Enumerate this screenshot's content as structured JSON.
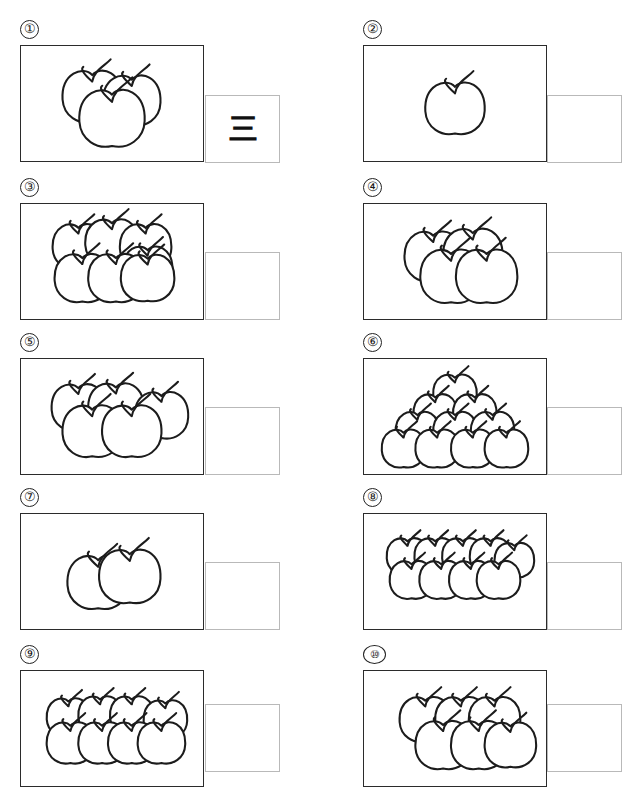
{
  "worksheet": {
    "title": "Count the apples worksheet",
    "page_width": 640,
    "page_height": 796,
    "answer_box_label": "answer-box",
    "items": [
      {
        "number": "①",
        "apple_count": 3,
        "answer": "三",
        "answer_filled": true,
        "arrangement": "cluster",
        "num_x": 20,
        "num_y": 20,
        "box_x": 20,
        "box_y": 45,
        "box_w": 184,
        "box_h": 117,
        "ans_x": 205,
        "ans_y": 95,
        "ans_w": 75,
        "ans_h": 68
      },
      {
        "number": "②",
        "apple_count": 1,
        "answer": "",
        "answer_filled": false,
        "arrangement": "cluster",
        "num_x": 363,
        "num_y": 20,
        "box_x": 363,
        "box_y": 45,
        "box_w": 184,
        "box_h": 117,
        "ans_x": 547,
        "ans_y": 95,
        "ans_w": 75,
        "ans_h": 68
      },
      {
        "number": "③",
        "apple_count": 7,
        "answer": "",
        "answer_filled": false,
        "arrangement": "stack",
        "num_x": 20,
        "num_y": 178,
        "box_x": 20,
        "box_y": 203,
        "box_w": 184,
        "box_h": 117,
        "ans_x": 205,
        "ans_y": 252,
        "ans_w": 75,
        "ans_h": 68
      },
      {
        "number": "④",
        "apple_count": 4,
        "answer": "",
        "answer_filled": false,
        "arrangement": "cluster",
        "num_x": 363,
        "num_y": 178,
        "box_x": 363,
        "box_y": 203,
        "box_w": 184,
        "box_h": 117,
        "ans_x": 547,
        "ans_y": 252,
        "ans_w": 75,
        "ans_h": 68
      },
      {
        "number": "⑤",
        "apple_count": 5,
        "answer": "",
        "answer_filled": false,
        "arrangement": "cluster",
        "num_x": 20,
        "num_y": 333,
        "box_x": 20,
        "box_y": 358,
        "box_w": 184,
        "box_h": 117,
        "ans_x": 205,
        "ans_y": 407,
        "ans_w": 75,
        "ans_h": 68
      },
      {
        "number": "⑥",
        "apple_count": 10,
        "answer": "",
        "answer_filled": false,
        "arrangement": "pyramid",
        "num_x": 363,
        "num_y": 333,
        "box_x": 363,
        "box_y": 358,
        "box_w": 184,
        "box_h": 117,
        "ans_x": 547,
        "ans_y": 407,
        "ans_w": 75,
        "ans_h": 68
      },
      {
        "number": "⑦",
        "apple_count": 2,
        "answer": "",
        "answer_filled": false,
        "arrangement": "cluster",
        "num_x": 20,
        "num_y": 488,
        "box_x": 20,
        "box_y": 513,
        "box_w": 184,
        "box_h": 117,
        "ans_x": 205,
        "ans_y": 562,
        "ans_w": 75,
        "ans_h": 68
      },
      {
        "number": "⑧",
        "apple_count": 9,
        "answer": "",
        "answer_filled": false,
        "arrangement": "two-rows",
        "num_x": 363,
        "num_y": 488,
        "box_x": 363,
        "box_y": 513,
        "box_w": 184,
        "box_h": 117,
        "ans_x": 547,
        "ans_y": 562,
        "ans_w": 75,
        "ans_h": 68
      },
      {
        "number": "⑨",
        "apple_count": 8,
        "answer": "",
        "answer_filled": false,
        "arrangement": "two-rows",
        "num_x": 20,
        "num_y": 645,
        "box_x": 20,
        "box_y": 670,
        "box_w": 184,
        "box_h": 117,
        "ans_x": 205,
        "ans_y": 704,
        "ans_w": 75,
        "ans_h": 68
      },
      {
        "number": "⑩",
        "apple_count": 6,
        "answer": "",
        "answer_filled": false,
        "arrangement": "two-rows",
        "num_x": 363,
        "num_y": 645,
        "box_x": 363,
        "box_y": 670,
        "box_w": 184,
        "box_h": 117,
        "ans_x": 547,
        "ans_y": 704,
        "ans_w": 75,
        "ans_h": 68
      }
    ]
  },
  "apple_layouts": {
    "1": [
      [
        92,
        62,
        30
      ]
    ],
    "2": [
      [
        78,
        68,
        31
      ],
      [
        110,
        62,
        31
      ]
    ],
    "3": [
      [
        72,
        50,
        30
      ],
      [
        112,
        54,
        29
      ],
      [
        92,
        72,
        33
      ]
    ],
    "4": [
      [
        70,
        52,
        29
      ],
      [
        110,
        50,
        30
      ],
      [
        88,
        72,
        31
      ],
      [
        124,
        72,
        31
      ]
    ],
    "5": [
      [
        58,
        48,
        27
      ],
      [
        96,
        48,
        28
      ],
      [
        142,
        56,
        27
      ],
      [
        72,
        72,
        30
      ],
      [
        112,
        72,
        30
      ]
    ],
    "6": [
      [
        62,
        48,
        26
      ],
      [
        98,
        48,
        26
      ],
      [
        132,
        48,
        26
      ],
      [
        80,
        74,
        28
      ],
      [
        116,
        74,
        28
      ],
      [
        148,
        74,
        26
      ]
    ],
    "7": [
      [
        58,
        42,
        26
      ],
      [
        92,
        38,
        27
      ],
      [
        126,
        42,
        26
      ],
      [
        128,
        64,
        25
      ],
      [
        62,
        74,
        28
      ],
      [
        96,
        74,
        28
      ],
      [
        128,
        74,
        27
      ]
    ],
    "8": [
      [
        48,
        46,
        22
      ],
      [
        80,
        44,
        22
      ],
      [
        112,
        44,
        22
      ],
      [
        146,
        48,
        22
      ],
      [
        50,
        72,
        24
      ],
      [
        82,
        72,
        24
      ],
      [
        112,
        72,
        24
      ],
      [
        142,
        72,
        24
      ]
    ],
    "9": [
      [
        44,
        42,
        21
      ],
      [
        72,
        42,
        21
      ],
      [
        100,
        42,
        21
      ],
      [
        128,
        42,
        21
      ],
      [
        152,
        46,
        20
      ],
      [
        48,
        66,
        22
      ],
      [
        78,
        66,
        22
      ],
      [
        108,
        66,
        22
      ],
      [
        136,
        66,
        22
      ]
    ],
    "10": [
      [
        92,
        34,
        22
      ],
      [
        72,
        54,
        22
      ],
      [
        112,
        54,
        22
      ],
      [
        54,
        72,
        22
      ],
      [
        92,
        72,
        22
      ],
      [
        130,
        72,
        22
      ],
      [
        40,
        90,
        22
      ],
      [
        74,
        90,
        22
      ],
      [
        110,
        90,
        22
      ],
      [
        144,
        90,
        22
      ]
    ]
  }
}
